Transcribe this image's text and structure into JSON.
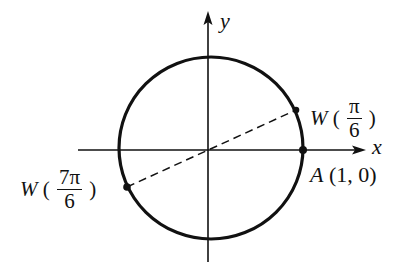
{
  "diagram": {
    "type": "unit-circle",
    "axes": {
      "x_label": "x",
      "y_label": "y"
    },
    "points": [
      {
        "id": "w-pi-over-6",
        "function_name": "W",
        "open_paren": "(",
        "numerator": "π",
        "denominator": "6",
        "close_paren": ")"
      },
      {
        "id": "w-7pi-over-6",
        "function_name": "W",
        "open_paren": "(",
        "numerator": "7π",
        "denominator": "6",
        "close_paren": ")"
      },
      {
        "id": "a",
        "name": "A",
        "coords": "(1, 0)"
      }
    ],
    "connector": "dashed line through origin joining W(π/6) and W(7π/6)",
    "colors": {
      "ink": "#111111",
      "background": "#ffffff"
    }
  }
}
